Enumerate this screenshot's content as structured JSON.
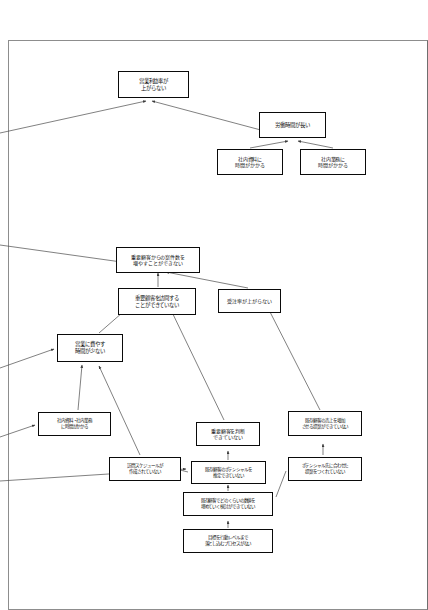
{
  "diagram": {
    "type": "issue-tree",
    "title_visible": false,
    "page_background": "#ffffff",
    "frame_color": "#8d8d8d",
    "node_border_color": "#1b1b1b",
    "node_fill": "#ffffff",
    "connector_color": "#4a4a4a",
    "nodes": [
      {
        "id": "n1",
        "label": "営業利益率が\n上がらない",
        "line1": "営業利益率が",
        "line2": "上がらない",
        "line3": ""
      },
      {
        "id": "n2",
        "label": "労働時間が長い",
        "line1": "労働時間が長い",
        "line2": "",
        "line3": ""
      },
      {
        "id": "n3",
        "label": "社内資料に\n時間がかかる",
        "line1": "社内資料に",
        "line2": "時間がかかる",
        "line3": ""
      },
      {
        "id": "n4",
        "label": "社内業務に\n時間がかかる",
        "line1": "社内業務に",
        "line2": "時間がかかる",
        "line3": ""
      },
      {
        "id": "n5",
        "label": "重要顧客からの案件数を\n増やすことができない",
        "line1": "重要顧客からの案件数を",
        "line2": "増やすことができない",
        "line3": ""
      },
      {
        "id": "n6",
        "label": "重要顧客を訪問する\nことができていない",
        "line1": "重要顧客を訪問する",
        "line2": "ことができていない",
        "line3": ""
      },
      {
        "id": "n7",
        "label": "受注率が上がらない",
        "line1": "受注率が上がらない",
        "line2": "",
        "line3": ""
      },
      {
        "id": "n8",
        "label": "営業に費やす\n時間が少ない",
        "line1": "営業に費やす",
        "line2": "時間が少ない",
        "line3": ""
      },
      {
        "id": "n9",
        "label": "社内資料・社内業務\nに時間がかかる",
        "line1": "社内資料・社内業務",
        "line2": "に時間がかかる",
        "line3": ""
      },
      {
        "id": "n10",
        "label": "訪問スケジュールが\n作成されていない",
        "line1": "訪問スケジュールが",
        "line2": "作成されていない",
        "line3": ""
      },
      {
        "id": "n11",
        "label": "重要顧客を判断\nできていない",
        "line1": "重要顧客を判断",
        "line2": "できていない",
        "line3": ""
      },
      {
        "id": "n12",
        "label": "既存顧客のポテンシャルを\n推定できていない",
        "line1": "既存顧客のポテンシャルを",
        "line2": "推定できていない",
        "line3": ""
      },
      {
        "id": "n13",
        "label": "既存顧客の売上を増加\nさせる提案ができていない",
        "line1": "既存顧客の売上を増加",
        "line2": "させる提案ができていない",
        "line3": ""
      },
      {
        "id": "n14",
        "label": "ポテンシャル先に合わせた\n提案をつくれていない",
        "line1": "ポテンシャル先に合わせた",
        "line2": "提案をつくれていない",
        "line3": ""
      },
      {
        "id": "n15",
        "label": "既存顧客でどのくらいの数値を\n埋めていく検討ができていない",
        "line1": "既存顧客でどのくらいの数値を",
        "line2": "埋めていく検討ができていない",
        "line3": ""
      },
      {
        "id": "n16",
        "label": "目標を行動レベルまで\n落とし込むプロセスがない",
        "line1": "目標を行動レベルまで",
        "line2": "落とし込むプロセスがない",
        "line3": ""
      }
    ]
  }
}
